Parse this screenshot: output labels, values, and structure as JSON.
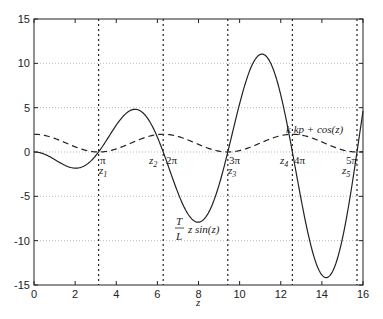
{
  "chart_data": {
    "type": "line",
    "title": "",
    "xlabel": "z",
    "ylabel": "",
    "xlim": [
      0,
      16
    ],
    "ylim": [
      -15,
      15
    ],
    "xticks": [
      0,
      2,
      4,
      6,
      8,
      10,
      12,
      14,
      16
    ],
    "yticks": [
      -15,
      -10,
      -5,
      0,
      5,
      10,
      15
    ],
    "grid": "horizontal dotted",
    "series": [
      {
        "name": "T/L z sin(z)",
        "style": "solid",
        "formula": "-z*sin(z)",
        "x": [
          0,
          1,
          2,
          3,
          4,
          4.9,
          6,
          7,
          8,
          9,
          10,
          11,
          12,
          13,
          14.2,
          15,
          15.7
        ],
        "values": [
          0,
          -0.84,
          -1.82,
          -0.42,
          3.03,
          4.81,
          1.68,
          -4.6,
          -7.91,
          -3.71,
          5.44,
          11.0,
          6.44,
          -5.46,
          -14.2,
          -9.75,
          0.0
        ]
      },
      {
        "name": "k kp + cos(z)",
        "style": "dashed",
        "formula": "1+cos(z)",
        "x": [
          0,
          3.14,
          6.28,
          9.42,
          12.57,
          15.71
        ],
        "values": [
          2,
          0,
          2,
          0,
          2,
          0
        ]
      }
    ],
    "vlines": [
      {
        "x": 3.1416,
        "label": "π",
        "root_label": "z1"
      },
      {
        "x": 6.2832,
        "label": "2π",
        "root_label": "z2"
      },
      {
        "x": 9.4248,
        "label": "3π",
        "root_label": "z3"
      },
      {
        "x": 12.566,
        "label": "4π",
        "root_label": "z4"
      },
      {
        "x": 15.708,
        "label": "5π",
        "root_label": "z5"
      }
    ],
    "annotations": [
      {
        "text": "T/L z sin(z)",
        "x": 8,
        "y": -10
      },
      {
        "text": "k kp + cos(z)",
        "x": 14.5,
        "y": 2.5
      }
    ]
  },
  "labels": {
    "xlabel": "z",
    "curve1_num": "T",
    "curve1_den": "L",
    "curve1_rest": "z sin(z)",
    "curve2": "k kp + cos(z)",
    "pi1": "π",
    "pi2": "2π",
    "pi3": "3π",
    "pi4": "4π",
    "pi5": "5π",
    "z1": "z",
    "z2": "z",
    "z3": "z",
    "z4": "z",
    "z5": "z",
    "s1": "1",
    "s2": "2",
    "s3": "3",
    "s4": "4",
    "s5": "5"
  }
}
